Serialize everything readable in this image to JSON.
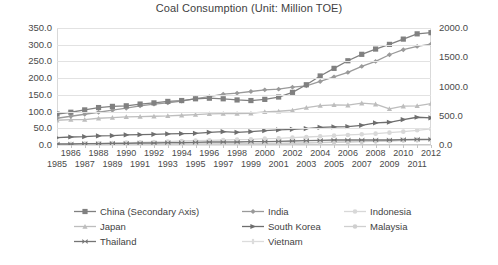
{
  "chart_data": {
    "type": "line",
    "title": "Coal Consumption (Unit: Million TOE)",
    "xlabel": "",
    "ylabel": "",
    "grid": true,
    "legend_position": "bottom",
    "x": [
      1985,
      1986,
      1987,
      1988,
      1989,
      1990,
      1991,
      1992,
      1993,
      1994,
      1995,
      1996,
      1997,
      1998,
      1999,
      2000,
      2001,
      2002,
      2003,
      2004,
      2005,
      2006,
      2007,
      2008,
      2009,
      2010,
      2011,
      2012
    ],
    "x_tick_labels_row1": [
      "",
      "1986",
      "",
      "1988",
      "",
      "1990",
      "",
      "1992",
      "",
      "1994",
      "",
      "1996",
      "",
      "1998",
      "",
      "2000",
      "",
      "2002",
      "",
      "2004",
      "",
      "2006",
      "",
      "2008",
      "",
      "2010",
      "",
      "2012"
    ],
    "x_tick_labels_row2": [
      "1985",
      "",
      "1987",
      "",
      "1989",
      "",
      "1991",
      "",
      "1993",
      "",
      "1995",
      "",
      "1997",
      "",
      "1999",
      "",
      "2001",
      "",
      "2003",
      "",
      "2005",
      "",
      "2007",
      "",
      "2009",
      "",
      "2011",
      ""
    ],
    "yaxis_left": {
      "min": 0,
      "max": 350,
      "step": 50,
      "tick_labels": [
        "350.0",
        "300.0",
        "250.0",
        "200.0",
        "150.0",
        "100.0",
        "50.0",
        "0.0"
      ]
    },
    "yaxis_right": {
      "min": 0,
      "max": 2000,
      "step": 500,
      "tick_labels": [
        "2000.0",
        "1500.0",
        "1000.0",
        "500.0",
        "0.0"
      ],
      "note": "Secondary axis used by China"
    },
    "series": [
      {
        "name": "China (Secondary Axis)",
        "axis": "right",
        "color": "#808080",
        "marker": "square",
        "values": [
          530,
          560,
          600,
          640,
          660,
          670,
          700,
          720,
          745,
          760,
          790,
          800,
          790,
          770,
          760,
          780,
          820,
          900,
          1030,
          1180,
          1310,
          1440,
          1550,
          1640,
          1720,
          1810,
          1900,
          1920
        ]
      },
      {
        "name": "India",
        "axis": "left",
        "color": "#9a9a9a",
        "marker": "diamond",
        "values": [
          80,
          86,
          92,
          98,
          104,
          110,
          117,
          122,
          126,
          131,
          139,
          145,
          152,
          155,
          160,
          165,
          167,
          173,
          177,
          190,
          204,
          217,
          235,
          250,
          270,
          285,
          295,
          302
        ]
      },
      {
        "name": "Indonesia",
        "axis": "left",
        "color": "#d8d8d8",
        "marker": "circle",
        "values": [
          2,
          3,
          4,
          5,
          6,
          7,
          8,
          9,
          10,
          12,
          13,
          14,
          15,
          16,
          17,
          19,
          20,
          22,
          24,
          26,
          28,
          30,
          32,
          34,
          37,
          40,
          44,
          48
        ]
      },
      {
        "name": "Japan",
        "axis": "left",
        "color": "#bdbdbd",
        "marker": "triangle",
        "values": [
          74,
          76,
          76,
          80,
          82,
          84,
          85,
          86,
          87,
          89,
          91,
          93,
          94,
          94,
          95,
          99,
          101,
          104,
          112,
          118,
          120,
          119,
          125,
          122,
          108,
          116,
          117,
          124
        ]
      },
      {
        "name": "South Korea",
        "axis": "left",
        "color": "#6e6e6e",
        "marker": "arrow",
        "values": [
          22,
          24,
          25,
          27,
          28,
          30,
          31,
          32,
          33,
          34,
          35,
          38,
          40,
          38,
          40,
          43,
          45,
          47,
          49,
          53,
          54,
          55,
          59,
          66,
          68,
          76,
          83,
          81
        ]
      },
      {
        "name": "Malaysia",
        "axis": "left",
        "color": "#cfcfcf",
        "marker": "circle",
        "values": [
          1,
          1,
          1,
          1,
          2,
          2,
          2,
          2,
          2,
          3,
          3,
          3,
          3,
          3,
          4,
          4,
          5,
          5,
          6,
          7,
          8,
          9,
          10,
          11,
          12,
          14,
          15,
          16
        ]
      },
      {
        "name": "Thailand",
        "axis": "left",
        "color": "#757575",
        "marker": "bowtie",
        "values": [
          3,
          3,
          4,
          4,
          5,
          5,
          6,
          6,
          7,
          7,
          8,
          9,
          9,
          9,
          10,
          10,
          11,
          12,
          13,
          14,
          15,
          15,
          15,
          15,
          15,
          16,
          17,
          17
        ]
      },
      {
        "name": "Vietnam",
        "axis": "left",
        "color": "#dcdcdc",
        "marker": "bar",
        "values": [
          2,
          2,
          2,
          2,
          2,
          2,
          2,
          2,
          3,
          3,
          3,
          3,
          4,
          4,
          4,
          5,
          5,
          6,
          7,
          8,
          9,
          10,
          11,
          12,
          13,
          14,
          15,
          16
        ]
      }
    ]
  },
  "legend": {
    "items": [
      {
        "label": "China (Secondary Axis)",
        "color": "#808080",
        "marker": "square"
      },
      {
        "label": "India",
        "color": "#9a9a9a",
        "marker": "diamond"
      },
      {
        "label": "Indonesia",
        "color": "#d8d8d8",
        "marker": "circle"
      },
      {
        "label": "Japan",
        "color": "#bdbdbd",
        "marker": "triangle"
      },
      {
        "label": "South Korea",
        "color": "#6e6e6e",
        "marker": "arrow"
      },
      {
        "label": "Malaysia",
        "color": "#cfcfcf",
        "marker": "circle"
      },
      {
        "label": "Thailand",
        "color": "#757575",
        "marker": "bowtie"
      },
      {
        "label": "Vietnam",
        "color": "#dcdcdc",
        "marker": "bar"
      }
    ]
  }
}
